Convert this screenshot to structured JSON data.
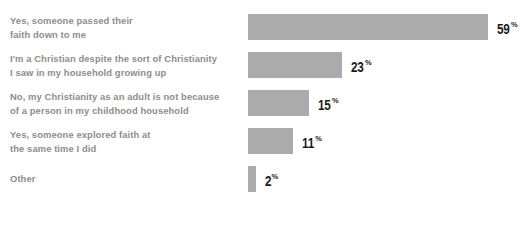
{
  "chart_data": {
    "type": "bar",
    "orientation": "horizontal",
    "title": "",
    "subtitle": "",
    "xlabel": "",
    "ylabel": "",
    "grid": false,
    "legend": false,
    "value_suffix": "%",
    "xlim": [
      0,
      59
    ],
    "categories": [
      "Yes, someone passed their\nfaith down to me",
      "I'm a Christian despite the sort of Christianity\nI saw in my household growing up",
      "No, my Christianity as an adult is not because\nof a person in my childhood household",
      "Yes, someone explored faith at\nthe same time I did",
      "Other"
    ],
    "values": [
      59,
      23,
      15,
      11,
      2
    ],
    "value_labels": [
      "59",
      "23",
      "15",
      "11",
      "2"
    ],
    "colors": {
      "bar": "#ababab",
      "label_text": "#8d8d8d",
      "value_text": "#1c1c1c",
      "background": "#ffffff"
    }
  }
}
